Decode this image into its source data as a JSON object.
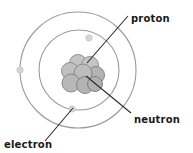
{
  "diagram": {
    "background_color": "#ffffff",
    "labels": {
      "proton": "proton",
      "neutron": "neutron",
      "electron": "electron"
    },
    "label_positions": {
      "proton": {
        "x": 131,
        "y": 18
      },
      "neutron": {
        "x": 134,
        "y": 119
      },
      "electron": {
        "x": 4,
        "y": 146
      }
    },
    "colors": {
      "orbit_stroke": "#9a9a9a",
      "nucleon_fill": "#b3b3b3",
      "nucleon_fill_light": "#c4c4c4",
      "nucleon_stroke": "#7d7d7d",
      "electron_fill": "#d6d6d6",
      "electron_stroke": "#c0c0c0",
      "leader_line": "#2b2b2b",
      "text": "#1a1a1a"
    },
    "nucleus": {
      "center": {
        "x": 81,
        "y": 74
      },
      "nucleons": [
        {
          "cx": 78,
          "cy": 63,
          "r": 8.5,
          "shade": "light"
        },
        {
          "cx": 90,
          "cy": 65,
          "r": 8.5,
          "shade": "light"
        },
        {
          "cx": 70,
          "cy": 71,
          "r": 8.5,
          "shade": "light"
        },
        {
          "cx": 96,
          "cy": 75,
          "r": 8.5,
          "shade": "mid"
        },
        {
          "cx": 83,
          "cy": 73,
          "r": 9.0,
          "shade": "mid"
        },
        {
          "cx": 71,
          "cy": 83,
          "r": 9.0,
          "shade": "mid"
        },
        {
          "cx": 85,
          "cy": 85,
          "r": 8.5,
          "shade": "mid"
        },
        {
          "cx": 95,
          "cy": 84,
          "r": 7.5,
          "shade": "mid"
        }
      ]
    },
    "orbits": [
      {
        "name": "outer-orbit",
        "cx": 78,
        "cy": 70,
        "r": 58
      },
      {
        "name": "inner-orbit",
        "cx": 79,
        "cy": 70,
        "r": 40
      }
    ],
    "electrons": [
      {
        "name": "electron-outer-left",
        "cx": 20,
        "cy": 70,
        "r": 3.2
      },
      {
        "name": "electron-inner-upper-right",
        "cx": 89,
        "cy": 38,
        "r": 3.2
      },
      {
        "name": "electron-inner-lower-left",
        "cx": 72,
        "cy": 109,
        "r": 3.2
      }
    ],
    "leader_lines": [
      {
        "name": "proton-leader",
        "x1": 128,
        "y1": 16,
        "x2": 87,
        "y2": 63
      },
      {
        "name": "neutron-leader",
        "x1": 86,
        "y1": 76,
        "x2": 131,
        "y2": 113
      },
      {
        "name": "electron-leader",
        "x1": 45,
        "y1": 141,
        "x2": 73,
        "y2": 108
      }
    ]
  }
}
